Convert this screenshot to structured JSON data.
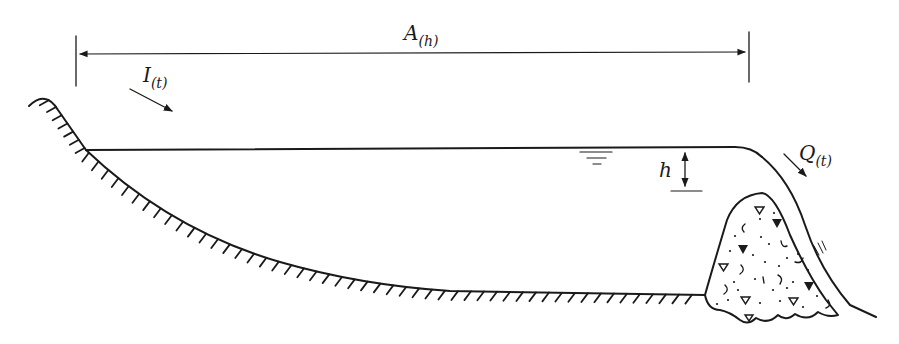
{
  "diagram": {
    "labels": {
      "area_main": "A",
      "area_sub": "(h)",
      "inflow_main": "I",
      "inflow_sub": "(t)",
      "outflow_main": "Q",
      "outflow_sub": "(t)",
      "head": "h"
    },
    "elements": [
      {
        "id": "area-dimension",
        "description": "Horizontal double-headed dimension line spanning reservoir surface width A(h)"
      },
      {
        "id": "inflow-arrow",
        "description": "Arrow indicating inflow I(t) entering from upstream"
      },
      {
        "id": "water-surface",
        "description": "Horizontal reservoir water surface line with water-level symbol"
      },
      {
        "id": "head-dimension",
        "description": "Vertical double-headed arrow showing head h above crest"
      },
      {
        "id": "reservoir-bed",
        "description": "Curved hatched ground line forming the reservoir bottom"
      },
      {
        "id": "dam",
        "description": "Embankment dam body with rock/aggregate fill pattern"
      },
      {
        "id": "overflow-nappe",
        "description": "Water flowing over dam crest and down downstream face"
      },
      {
        "id": "outflow-arrow",
        "description": "Arrow indicating outflow Q(t) over the dam"
      }
    ],
    "colors": {
      "ink": "#1a1a1a",
      "background": "#ffffff"
    }
  }
}
